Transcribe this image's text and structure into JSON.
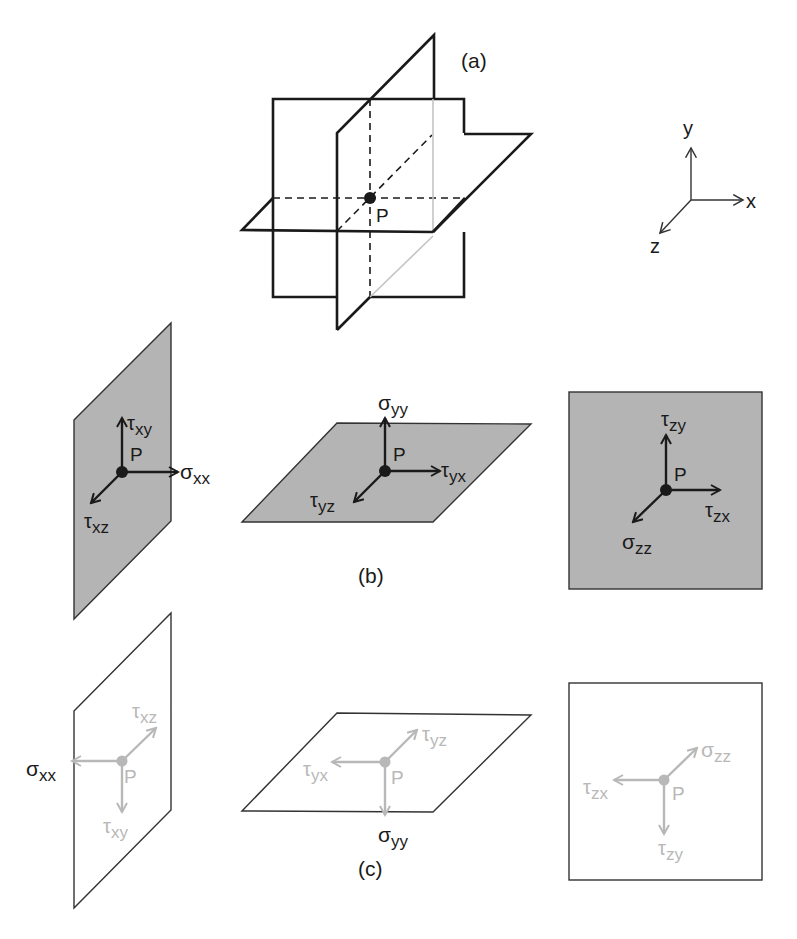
{
  "panels": {
    "a": {
      "label": "(a)",
      "point_label": "P",
      "description": "Three mutually orthogonal planes intersecting at point P"
    },
    "b": {
      "label": "(b)",
      "x_face": {
        "point": "P",
        "normal": {
          "sym": "σ",
          "sub": "xx"
        },
        "shear1": {
          "sym": "τ",
          "sub": "xy"
        },
        "shear2": {
          "sym": "τ",
          "sub": "xz"
        }
      },
      "y_face": {
        "point": "P",
        "normal": {
          "sym": "σ",
          "sub": "yy"
        },
        "shear1": {
          "sym": "τ",
          "sub": "yx"
        },
        "shear2": {
          "sym": "τ",
          "sub": "yz"
        }
      },
      "z_face": {
        "point": "P",
        "normal": {
          "sym": "σ",
          "sub": "zz"
        },
        "shear1": {
          "sym": "τ",
          "sub": "zy"
        },
        "shear2": {
          "sym": "τ",
          "sub": "zx"
        }
      }
    },
    "c": {
      "label": "(c)",
      "x_face": {
        "point": "P",
        "normal": {
          "sym": "σ",
          "sub": "xx"
        },
        "shear1": {
          "sym": "τ",
          "sub": "xz"
        },
        "shear2": {
          "sym": "τ",
          "sub": "xy"
        }
      },
      "y_face": {
        "point": "P",
        "normal": {
          "sym": "σ",
          "sub": "yy"
        },
        "shear1": {
          "sym": "τ",
          "sub": "yz"
        },
        "shear2": {
          "sym": "τ",
          "sub": "yx"
        }
      },
      "z_face": {
        "point": "P",
        "normal": {
          "sym": "σ",
          "sub": "zz"
        },
        "shear1": {
          "sym": "τ",
          "sub": "zx"
        },
        "shear2": {
          "sym": "τ",
          "sub": "zy"
        }
      }
    }
  },
  "axes": {
    "x": "x",
    "y": "y",
    "z": "z"
  },
  "colors": {
    "line": "#1a1a1a",
    "face_fill": "#b4b4b4",
    "faded": "#b8b8b8",
    "background": "#ffffff"
  }
}
